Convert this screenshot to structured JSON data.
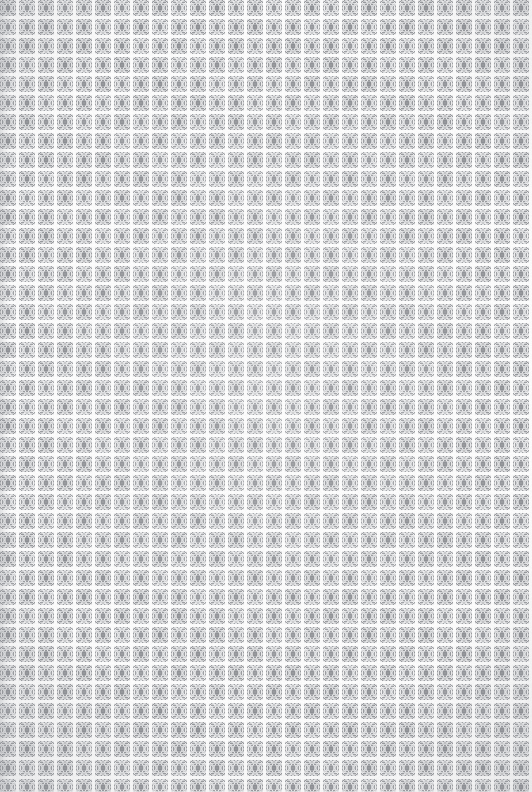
{
  "image": {
    "kind": "repeating-texture",
    "subject": "woven grid fabric swatch",
    "width_px": 532,
    "height_px": 792,
    "has_text": false,
    "has_ui_chrome": false,
    "description": "Seamless light-gray woven mesh texture: a regular grid of speckled square tiles separated by near-white gridlines, each tile carrying a faint darker core."
  },
  "grid": {
    "pitch_px": 19,
    "columns": 28,
    "rows": 42,
    "rows_fully_visible": 41,
    "bottom_row_clipped": true,
    "right_edge_clipped": false,
    "origin_x_px": 0,
    "origin_y_px": 0,
    "gridline_width_px": 3,
    "tile_size_px": 16
  },
  "tile": {
    "core_blob_width_px": 3,
    "core_blob_height_px": 6,
    "inner_ring_inset_px": 3,
    "noise_cell_px": 1,
    "noise_amplitude": 26,
    "symmetry": "mirrored-quadrants"
  },
  "colors": {
    "gridline": "#fbfbfb",
    "page_background": "#f2f2f2",
    "tile_base": "#d4d5d7",
    "tile_speckle_light": "#ededee",
    "tile_speckle_dark": "#9b9da1",
    "tile_inner_ring": "#e2e3e5",
    "tile_core_blob": "#8e9095",
    "vignette_edge": "#8c8f96"
  },
  "rendering": {
    "seed": 20240917,
    "image_rendering": "pixelated",
    "vignette_enabled": true,
    "left_edge_shade_enabled": true
  }
}
